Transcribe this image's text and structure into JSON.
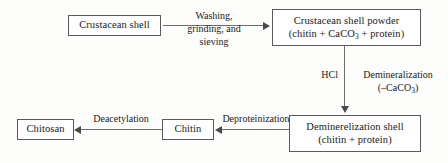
{
  "diagram": {
    "background_color": "#fdfdfc",
    "line_color": "#6d6d6d",
    "text_color": "#1a1a1a",
    "nodes": [
      {
        "id": "crustacean-shell",
        "line1": "Crustacean shell",
        "line2": ""
      },
      {
        "id": "shell-powder",
        "line1": "Crustacean shell powder",
        "line2_prefix": "(chitin + CaCO",
        "line2_sub": "3",
        "line2_suffix": " + protein)"
      },
      {
        "id": "demineralized-shell",
        "line1": "Deminerelization shell",
        "line2": "(chitin + protein)"
      },
      {
        "id": "chitin",
        "line1": "Chitin",
        "line2": ""
      },
      {
        "id": "chitosan",
        "line1": "Chitosan",
        "line2": ""
      }
    ],
    "edge_labels": {
      "washing_line1": "Washing,",
      "washing_line2": "grinding, and",
      "washing_line3": "sieving",
      "hcl": "HCl",
      "demineralization_line1": "Demineralization",
      "demineralization_line2_prefix": "(–CaCO",
      "demineralization_line2_sub": "3",
      "demineralization_line2_suffix": ")",
      "deproteinization": "Deproteinization",
      "deacetylation": "Deacetylation"
    }
  }
}
